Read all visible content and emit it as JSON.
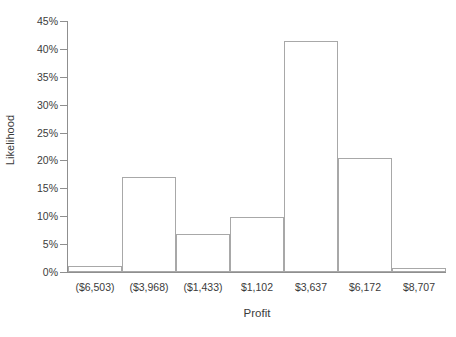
{
  "chart_data": {
    "type": "bar",
    "title": "",
    "subtitle": "",
    "xlabel": "Profit",
    "ylabel": "Likelihood",
    "categories": [
      "($6,503)",
      "($3,968)",
      "($1,433)",
      "$1,102",
      "$3,637",
      "$6,172",
      "$8,707"
    ],
    "values": [
      1.0,
      17.0,
      6.8,
      9.9,
      41.5,
      20.5,
      0.8
    ],
    "value_labels": [
      "1.0%",
      "17.0%",
      "6.8%",
      "9.9%",
      "41.5%",
      "20.5%",
      "0.8%"
    ],
    "ylim": [
      0,
      45
    ],
    "ytick_values": [
      0,
      5,
      10,
      15,
      20,
      25,
      30,
      35,
      40,
      45
    ],
    "ytick_labels": [
      "0%",
      "5%",
      "10%",
      "15%",
      "20%",
      "25%",
      "30%",
      "35%",
      "40%",
      "45%"
    ],
    "grid": false,
    "legend": false,
    "legend_position": "none",
    "bar_style": {
      "fill": "#ffffff",
      "edge": "#a8a8a8",
      "gap": 0
    },
    "axis_color": "#8f8f8f",
    "text_color": "#3b3b3b",
    "background": "#ffffff"
  }
}
